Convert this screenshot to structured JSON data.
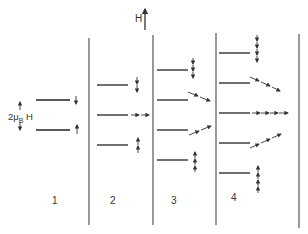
{
  "field": {
    "label": "H"
  },
  "splitting_label": {
    "prefix": "2μ",
    "subscript": "B",
    "suffix": " H"
  },
  "colors": {
    "line": "#222222",
    "divider": "#555555",
    "arrow": "#333333",
    "background": "#ffffff"
  },
  "panels": [
    {
      "label": "1",
      "levels": 2,
      "arrows": [
        "down",
        "up"
      ]
    },
    {
      "label": "2",
      "levels": 3,
      "arrows": [
        "down-down",
        "right-right",
        "up-up"
      ]
    },
    {
      "label": "3",
      "levels": 4,
      "arrows": [
        "down-down-down",
        "diag-down",
        "diag-up",
        "up-up-up"
      ]
    },
    {
      "label": "4",
      "levels": 5,
      "arrows": [
        "down-down-down-down",
        "diag-down",
        "right-right-right-right",
        "diag-up",
        "up-up-up-up"
      ]
    }
  ]
}
